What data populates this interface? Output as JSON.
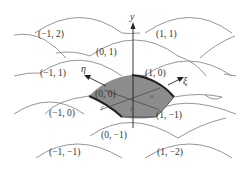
{
  "figure": {
    "type": "lattice-diagram",
    "cell_labels": [
      {
        "text": "(−1, 2)",
        "x": 38,
        "y": 37
      },
      {
        "text": "(1, 1)",
        "x": 156,
        "y": 37
      },
      {
        "text": "(0, 1)",
        "x": 96,
        "y": 55
      },
      {
        "text": "(−1, 1)",
        "x": 40,
        "y": 76
      },
      {
        "text": "(1, 0)",
        "x": 146,
        "y": 76
      },
      {
        "text": "(0, 0)",
        "x": 92,
        "y": 98
      },
      {
        "text": "(−1, 0)",
        "x": 48,
        "y": 116
      },
      {
        "text": "(1, −1)",
        "x": 154,
        "y": 118
      },
      {
        "text": "(0, −1)",
        "x": 100,
        "y": 138
      },
      {
        "text": "(−1, −1)",
        "x": 50,
        "y": 156
      },
      {
        "text": "(1, −2)",
        "x": 157,
        "y": 156
      }
    ],
    "axes": {
      "y_label": "y",
      "xi_label": "ξ",
      "eta_label": "η"
    },
    "region_labels": {
      "a": "a",
      "b": "b",
      "c": "c"
    },
    "colors": {
      "shaded_region": "#8c8c8c",
      "region_border": "#222222",
      "arcs": "#8a8a8a",
      "text": "#333333"
    }
  }
}
